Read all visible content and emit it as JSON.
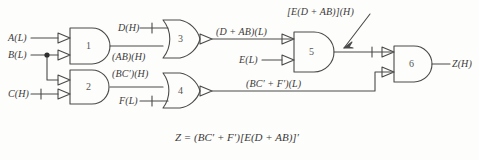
{
  "diagram": {
    "line_color": "#4a4a4a",
    "text_color": "#3a3a3a",
    "background": "#fdfdfb",
    "inputs": [
      {
        "id": "A",
        "label": "A(L)"
      },
      {
        "id": "B",
        "label": "B(L)"
      },
      {
        "id": "C",
        "label": "C(H)"
      },
      {
        "id": "D",
        "label": "D(H)"
      },
      {
        "id": "F",
        "label": "F(L)"
      },
      {
        "id": "E",
        "label": "E(L)"
      }
    ],
    "output": {
      "id": "Z",
      "label": "Z(H)"
    },
    "gates": [
      {
        "num": "1",
        "type": "and",
        "inverted_inputs": true,
        "inverted_output": false
      },
      {
        "num": "2",
        "type": "and",
        "inverted_inputs": true,
        "inverted_output": false
      },
      {
        "num": "3",
        "type": "or",
        "inverted_inputs": false,
        "inverted_output": true
      },
      {
        "num": "4",
        "type": "or",
        "inverted_inputs": false,
        "inverted_output": true
      },
      {
        "num": "5",
        "type": "and",
        "inverted_inputs": true,
        "inverted_output": false
      },
      {
        "num": "6",
        "type": "and",
        "inverted_inputs": true,
        "inverted_output": false
      }
    ],
    "wire_labels": [
      {
        "id": "ab",
        "text": "(AB)(H)"
      },
      {
        "id": "bcprime",
        "text": "(BC′)(H)"
      },
      {
        "id": "dplusab",
        "text": "(D + AB)(L)"
      },
      {
        "id": "bcfprime",
        "text": "(BC′ + F′)(L)"
      }
    ],
    "annotation": {
      "text": "[E(D + AB)](H)"
    },
    "equation": {
      "text": "Z = (BC′ + F′)[E(D + AB)]′"
    }
  }
}
